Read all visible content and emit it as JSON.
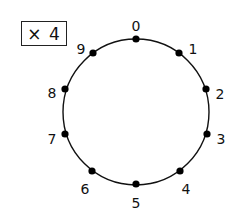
{
  "multiplier_box": {
    "label": "× 4",
    "multiplier": 4
  },
  "circle": {
    "center": [
      136,
      112
    ],
    "radius": 73,
    "stroke_color": "#111111",
    "dot_color": "#000000"
  },
  "points": [
    {
      "label": "0",
      "dot": [
        136,
        39
      ],
      "text": [
        136,
        27
      ]
    },
    {
      "label": "1",
      "dot": [
        179,
        53
      ],
      "text": [
        193,
        50
      ]
    },
    {
      "label": "2",
      "dot": [
        206,
        89
      ],
      "text": [
        220,
        95
      ]
    },
    {
      "label": "3",
      "dot": [
        207,
        134
      ],
      "text": [
        221,
        140
      ]
    },
    {
      "label": "4",
      "dot": [
        180,
        171
      ],
      "text": [
        186,
        190
      ]
    },
    {
      "label": "5",
      "dot": [
        136,
        184
      ],
      "text": [
        136,
        204
      ]
    },
    {
      "label": "6",
      "dot": [
        92,
        171
      ],
      "text": [
        85,
        190
      ]
    },
    {
      "label": "7",
      "dot": [
        65,
        134
      ],
      "text": [
        52,
        140
      ]
    },
    {
      "label": "8",
      "dot": [
        65,
        89
      ],
      "text": [
        52,
        94
      ]
    },
    {
      "label": "9",
      "dot": [
        93,
        53
      ],
      "text": [
        81,
        50
      ]
    }
  ]
}
